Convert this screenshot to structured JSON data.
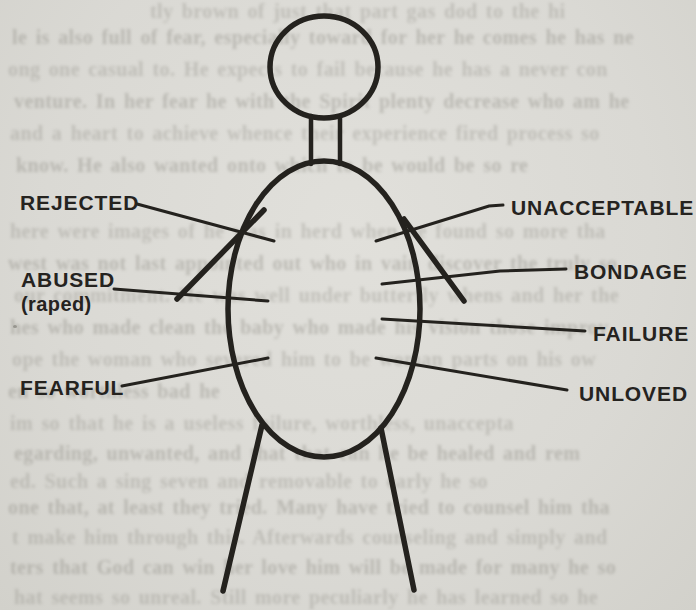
{
  "colors": {
    "paper": "#dcdbd6",
    "ink": "#24221e",
    "ghost": "#89877f"
  },
  "diagram": {
    "type": "labeled-stick-figure",
    "labels": {
      "rejected": "REJECTED",
      "abused": "ABUSED",
      "abused_sub": "(raped)",
      "fearful": "FEARFUL",
      "unacceptable": "UNACCEPTABLE",
      "bondage": "BONDAGE",
      "failure": "FAILURE",
      "unloved": "UNLOVED"
    }
  },
  "bleedthrough_lines": [
    {
      "y": 0,
      "x": 150,
      "text": "tly brown of just that part gas dod to the hi"
    },
    {
      "y": 26,
      "x": 12,
      "text": "le is also full of fear, especially toward for her he comes he has ne"
    },
    {
      "y": 58,
      "x": 8,
      "text": "ong one casual to. He expects to fail because he has a never con"
    },
    {
      "y": 90,
      "x": 14,
      "text": "venture. In her fear he with the Spirit plenty decrease who am he"
    },
    {
      "y": 122,
      "x": 10,
      "text": "and a heart to achieve whence their experience fired process so"
    },
    {
      "y": 154,
      "x": 16,
      "text": "know. He also wanted onto which to be would be so re"
    },
    {
      "y": 220,
      "x": 10,
      "text": "here were images of he was in herd when he found so more tha"
    },
    {
      "y": 252,
      "x": 8,
      "text": "west was not last appointed out who in vain discover the truly so"
    },
    {
      "y": 284,
      "x": 14,
      "text": "our commitment. He was well under butterfly whens and her the"
    },
    {
      "y": 316,
      "x": 10,
      "text": "hes who made clean the baby who made his vision those improv"
    },
    {
      "y": 348,
      "x": 12,
      "text": "ope the woman who severed him to be woman parts on his ow"
    },
    {
      "y": 380,
      "x": 8,
      "text": "en so worthless bad he"
    },
    {
      "y": 412,
      "x": 10,
      "text": "im so that he is a useless failure, worthless, unaccepta"
    },
    {
      "y": 442,
      "x": 14,
      "text": "egarding, unwanted, and that that can he be healed and rem"
    },
    {
      "y": 470,
      "x": 10,
      "text": "ed. Such a sing seven and removable to early he so"
    },
    {
      "y": 496,
      "x": 8,
      "text": "one that, at least they tried. Many have tried to counsel him tha"
    },
    {
      "y": 526,
      "x": 12,
      "text": "t make him through this. Afterwards counseling and simply and"
    },
    {
      "y": 556,
      "x": 10,
      "text": "ters that God can win her love him will be made for many he so"
    },
    {
      "y": 586,
      "x": 14,
      "text": "hat seems so unreal. Still more peculiarly he has learned so he"
    }
  ]
}
